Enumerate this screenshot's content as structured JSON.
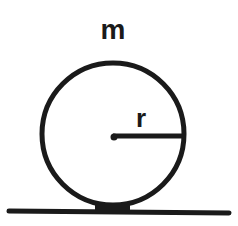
{
  "diagram": {
    "labels": {
      "mass": "m",
      "radius": "r"
    },
    "colors": {
      "stroke": "#1a1a1a",
      "background": "#ffffff"
    },
    "shapes": {
      "disk": {
        "cx": 113,
        "cy": 134,
        "r": 72
      },
      "radius_line": {
        "x1": 113,
        "y1": 136,
        "x2": 184,
        "y2": 136
      },
      "ground": {
        "x1": 8,
        "y1": 212,
        "x2": 230,
        "y2": 213
      }
    }
  }
}
